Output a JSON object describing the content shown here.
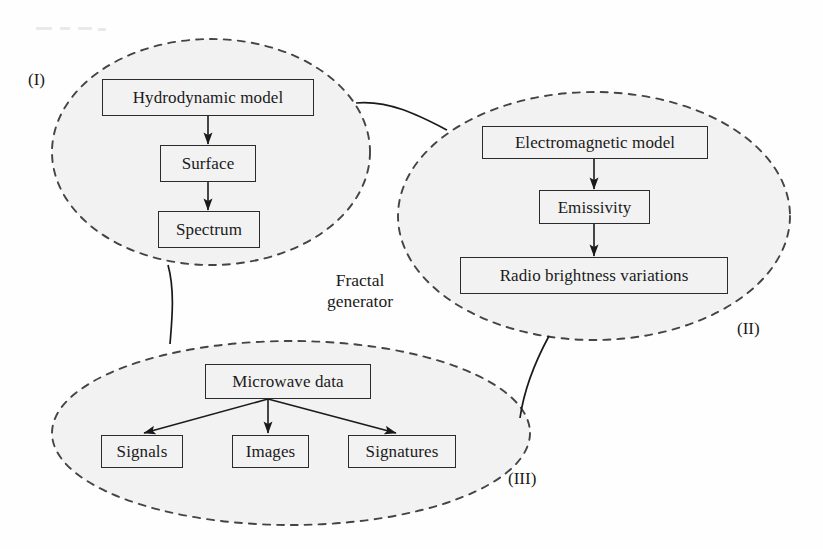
{
  "figure": {
    "background_color": "#fefefe",
    "ellipse_fill": "#f2f2f2",
    "ellipse_stroke": "#444444",
    "box_fill": "#f2f2f2",
    "box_stroke": "#2b2b2b",
    "arrow_color": "#1a1a1a",
    "text_color": "#1a1a1a",
    "center_label": "Fractal\ngenerator"
  },
  "groups": [
    {
      "id": "group-1",
      "label": "(I)",
      "label_x": 28,
      "label_y": 71,
      "ellipse": {
        "cx": 211,
        "cy": 152,
        "rx": 159,
        "ry": 113
      },
      "nodes": [
        {
          "id": "hydrodynamic-model",
          "label": "Hydrodynamic model",
          "x": 102,
          "y": 79,
          "w": 212,
          "h": 37,
          "font_size": 17
        },
        {
          "id": "surface",
          "label": "Surface",
          "x": 160,
          "y": 145,
          "w": 96,
          "h": 37,
          "font_size": 17
        },
        {
          "id": "spectrum",
          "label": "Spectrum",
          "x": 158,
          "y": 211,
          "w": 102,
          "h": 37,
          "font_size": 17
        }
      ],
      "arrows": [
        {
          "from": "hydrodynamic-model",
          "to": "surface",
          "x1": 208,
          "y1": 116,
          "x2": 208,
          "y2": 144
        },
        {
          "from": "surface",
          "to": "spectrum",
          "x1": 208,
          "y1": 182,
          "x2": 208,
          "y2": 210
        }
      ]
    },
    {
      "id": "group-2",
      "label": "(II)",
      "label_x": 737,
      "label_y": 320,
      "ellipse": {
        "cx": 594,
        "cy": 216,
        "rx": 196,
        "ry": 124
      },
      "nodes": [
        {
          "id": "electromagnetic-model",
          "label": "Electromagnetic model",
          "x": 482,
          "y": 126,
          "w": 226,
          "h": 33,
          "font_size": 17
        },
        {
          "id": "emissivity",
          "label": "Emissivity",
          "x": 539,
          "y": 190,
          "w": 111,
          "h": 34,
          "font_size": 17
        },
        {
          "id": "radio-brightness-variations",
          "label": "Radio brightness variations",
          "x": 460,
          "y": 257,
          "w": 268,
          "h": 37,
          "font_size": 17
        }
      ],
      "arrows": [
        {
          "from": "electromagnetic-model",
          "to": "emissivity",
          "x1": 594,
          "y1": 159,
          "x2": 594,
          "y2": 189
        },
        {
          "from": "emissivity",
          "to": "radio-brightness-variations",
          "x1": 594,
          "y1": 224,
          "x2": 594,
          "y2": 256
        }
      ]
    },
    {
      "id": "group-3",
      "label": "(III)",
      "label_x": 508,
      "label_y": 470,
      "ellipse": {
        "cx": 291,
        "cy": 433,
        "rx": 239,
        "ry": 92
      },
      "nodes": [
        {
          "id": "microwave-data",
          "label": "Microwave data",
          "x": 205,
          "y": 364,
          "w": 166,
          "h": 35,
          "font_size": 17
        },
        {
          "id": "signals",
          "label": "Signals",
          "x": 101,
          "y": 435,
          "w": 82,
          "h": 33,
          "font_size": 17
        },
        {
          "id": "images",
          "label": "Images",
          "x": 232,
          "y": 435,
          "w": 77,
          "h": 33,
          "font_size": 17
        },
        {
          "id": "signatures",
          "label": "Signatures",
          "x": 348,
          "y": 435,
          "w": 108,
          "h": 33,
          "font_size": 17
        }
      ],
      "arrows": [
        {
          "from": "microwave-data",
          "to": "signals",
          "x1": 268,
          "y1": 399,
          "x2": 144,
          "y2": 433
        },
        {
          "from": "microwave-data",
          "to": "images",
          "x1": 268,
          "y1": 399,
          "x2": 268,
          "y2": 433
        },
        {
          "from": "microwave-data",
          "to": "signatures",
          "x1": 268,
          "y1": 399,
          "x2": 396,
          "y2": 433
        }
      ]
    }
  ],
  "connectors": [
    {
      "id": "connector-i-to-ii",
      "from": "group-1",
      "to": "group-2",
      "path": "M 356 103 C 390 100 420 116 447 130"
    },
    {
      "id": "connector-i-to-iii",
      "from": "group-1",
      "to": "group-3",
      "path": "M 168 265 C 175 290 172 320 170 344"
    },
    {
      "id": "connector-ii-to-iii",
      "from": "group-2",
      "to": "group-3",
      "path": "M 549 336 C 536 360 524 390 520 418"
    }
  ],
  "scan_artifacts": [
    {
      "x": 36,
      "y": 27,
      "w": 16
    },
    {
      "x": 60,
      "y": 27,
      "w": 10
    },
    {
      "x": 78,
      "y": 27,
      "w": 14
    },
    {
      "x": 98,
      "y": 28,
      "w": 8
    }
  ]
}
